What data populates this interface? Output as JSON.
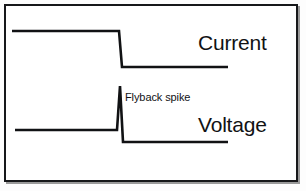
{
  "figure": {
    "background_color": "#ffffff",
    "trace_color": "#111214",
    "border_color": "#17181a",
    "width": 306,
    "height": 191
  },
  "labels": {
    "current": "Current",
    "voltage": "Voltage",
    "flyback": "Flyback spike"
  },
  "chart_data": {
    "type": "line",
    "xlabel": "",
    "ylabel": "",
    "grid": false,
    "legend_position": "right-inline",
    "xlim": [
      0,
      306
    ],
    "ylim": [
      191,
      0
    ],
    "annotations": [
      {
        "text": "Flyback spike",
        "x": 125,
        "y": 98
      },
      {
        "text": "Current",
        "x": 198,
        "y": 48
      },
      {
        "text": "Voltage",
        "x": 198,
        "y": 130
      }
    ],
    "series": [
      {
        "name": "Current",
        "color": "#111214",
        "points": [
          {
            "x": 12,
            "y": 31
          },
          {
            "x": 119,
            "y": 31
          },
          {
            "x": 122,
            "y": 67
          },
          {
            "x": 228,
            "y": 67
          }
        ]
      },
      {
        "name": "Voltage",
        "color": "#111214",
        "points": [
          {
            "x": 15,
            "y": 130
          },
          {
            "x": 117,
            "y": 130
          },
          {
            "x": 120,
            "y": 86
          },
          {
            "x": 123,
            "y": 142
          },
          {
            "x": 228,
            "y": 142
          }
        ]
      }
    ]
  }
}
